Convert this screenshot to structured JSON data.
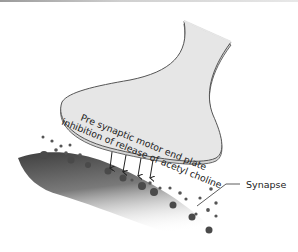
{
  "figure": {
    "terminal_label_line1": "Pre synaptic motor end plate",
    "terminal_label_line2": "inhibition of release of acetyl choline",
    "callouts": [
      {
        "id": "synapse",
        "label": "Synapse"
      }
    ],
    "arrow_count": 4,
    "colors": {
      "terminal_fill": "#e6e6e6",
      "terminal_stroke": "#555555",
      "muscle_dark": "#444444",
      "vesicle": "#555555",
      "text": "#222222"
    }
  }
}
